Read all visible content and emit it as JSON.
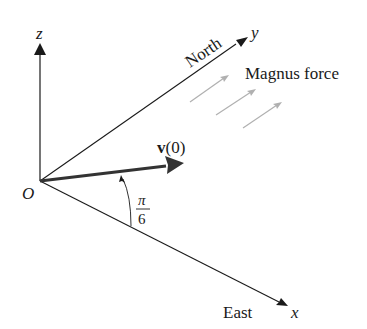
{
  "diagram": {
    "axes": {
      "z": {
        "label": "z"
      },
      "y": {
        "label": "y",
        "direction_label": "North"
      },
      "x": {
        "label": "x",
        "direction_label": "East"
      },
      "origin": {
        "label": "O"
      }
    },
    "velocity": {
      "label_bold": "v",
      "label_rest": "(0)"
    },
    "angle": {
      "numerator": "π",
      "denominator": "6"
    },
    "magnus": {
      "label": "Magnus force",
      "arrow_count": 3
    },
    "colors": {
      "ink": "#1a1a1a",
      "magnus_arrow": "#b0b0b0",
      "velocity_arrow": "#333333"
    }
  }
}
